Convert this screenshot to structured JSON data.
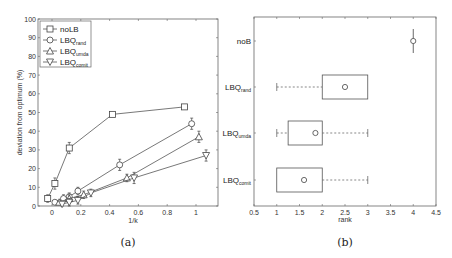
{
  "chart_data": [
    {
      "type": "line",
      "panel_caption": "(a)",
      "title": "",
      "xlabel": "1/k",
      "ylabel": "deviation from optimum (%)",
      "xlim": [
        -0.1,
        1.15
      ],
      "ylim": [
        0,
        100
      ],
      "xticks": [
        "0",
        "0.2",
        "0.4",
        "0.6",
        "0.8",
        "1"
      ],
      "yticks": [
        "0",
        "10",
        "20",
        "30",
        "40",
        "50",
        "60",
        "70",
        "80",
        "90",
        "100"
      ],
      "grid": false,
      "legend_position": "upper left",
      "error_bars": true,
      "series": [
        {
          "name": "noLB",
          "marker": "square",
          "x": [
            -0.03,
            0.02,
            0.12,
            0.42,
            0.92
          ],
          "y": [
            4,
            12,
            31,
            49,
            53
          ],
          "err": [
            2,
            3,
            3,
            1,
            1
          ]
        },
        {
          "name": "LBQrand",
          "marker": "circle",
          "x": [
            0.02,
            0.08,
            0.12,
            0.18,
            0.47,
            0.97
          ],
          "y": [
            2,
            4,
            5,
            8,
            22,
            44
          ],
          "err": [
            1,
            2,
            2,
            2,
            3,
            3
          ]
        },
        {
          "name": "LBQumda",
          "marker": "triangle-up",
          "x": [
            0.05,
            0.12,
            0.22,
            0.52,
            1.02
          ],
          "y": [
            2,
            4,
            6,
            15,
            37
          ],
          "err": [
            1,
            2,
            2,
            2,
            3
          ]
        },
        {
          "name": "LBQcomit",
          "marker": "triangle-down",
          "x": [
            0.07,
            0.12,
            0.18,
            0.27,
            0.57,
            1.07
          ],
          "y": [
            1,
            2,
            3,
            7,
            15,
            27
          ],
          "err": [
            1,
            2,
            2,
            2,
            3,
            3
          ]
        }
      ]
    },
    {
      "type": "box",
      "panel_caption": "(b)",
      "title": "",
      "xlabel": "rank",
      "ylabel": "",
      "xlim": [
        0.5,
        4.5
      ],
      "xticks": [
        "0.5",
        "1",
        "1.5",
        "2",
        "2.5",
        "3",
        "3.5",
        "4",
        "4.5"
      ],
      "categories": [
        "noB",
        "LBQrand",
        "LBQumda",
        "LBQcomit"
      ],
      "boxes": [
        {
          "name": "noB",
          "whisker_low": 4,
          "q1": 4,
          "q3": 4,
          "whisker_high": 4,
          "mean": 4
        },
        {
          "name": "LBQrand",
          "whisker_low": 1,
          "q1": 2,
          "q3": 3,
          "whisker_high": 3,
          "mean": 2.5
        },
        {
          "name": "LBQumda",
          "whisker_low": 1,
          "q1": 1.25,
          "q3": 2,
          "whisker_high": 3,
          "mean": 1.85
        },
        {
          "name": "LBQcomit",
          "whisker_low": 1,
          "q1": 1,
          "q3": 2,
          "whisker_high": 3,
          "mean": 1.6
        }
      ]
    }
  ],
  "labels": {
    "a_caption": "(a)",
    "b_caption": "(b)",
    "a_xlabel": "1/k",
    "a_ylabel": "deviation from optimum (%)",
    "b_xlabel": "rank",
    "legend": [
      {
        "base": "noLB",
        "sub": ""
      },
      {
        "base": "LBQ",
        "sub": "rand"
      },
      {
        "base": "LBQ",
        "sub": "umda"
      },
      {
        "base": "LBQ",
        "sub": "comit"
      }
    ],
    "b_categories": [
      {
        "base": "noB",
        "sub": ""
      },
      {
        "base": "LBQ",
        "sub": "rand"
      },
      {
        "base": "LBQ",
        "sub": "umda"
      },
      {
        "base": "LBQ",
        "sub": "comit"
      }
    ]
  }
}
